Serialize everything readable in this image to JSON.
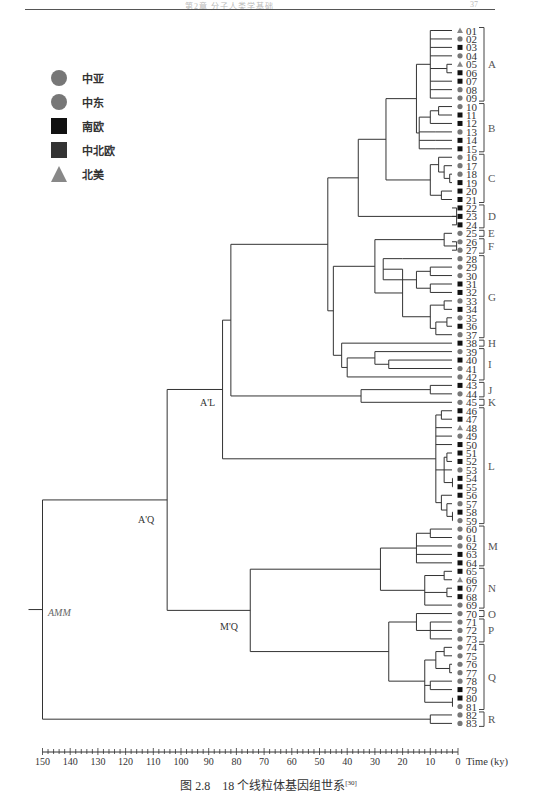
{
  "header": {
    "running_title": "第2章 分子人类学基础",
    "page_number": "37"
  },
  "legend": [
    {
      "label": "中亚",
      "shape": "circle",
      "color": "#777777"
    },
    {
      "label": "中东",
      "shape": "circle",
      "color": "#777777"
    },
    {
      "label": "南欧",
      "shape": "square",
      "color": "#111111"
    },
    {
      "label": "中北欧",
      "shape": "square",
      "color": "#333333"
    },
    {
      "label": "北美",
      "shape": "triangle",
      "color": "#888888"
    }
  ],
  "node_labels": {
    "root": "AMM",
    "aq": "A'Q",
    "al": "A'L",
    "mq": "M'Q"
  },
  "axis": {
    "label": "Time (ky)",
    "ticks": [
      "150",
      "140",
      "130",
      "120",
      "110",
      "100",
      "90",
      "80",
      "70",
      "60",
      "50",
      "40",
      "30",
      "20",
      "10",
      "0"
    ]
  },
  "caption": {
    "text": "图 2.8　18 个线粒体基因组世系",
    "ref": "[30]"
  },
  "chart_data": {
    "type": "dendrogram",
    "xlabel": "Time (ky)",
    "xlim": [
      150,
      0
    ],
    "tips": [
      "01",
      "02",
      "03",
      "04",
      "05",
      "06",
      "07",
      "08",
      "09",
      "10",
      "11",
      "12",
      "13",
      "14",
      "15",
      "16",
      "17",
      "18",
      "19",
      "20",
      "21",
      "22",
      "23",
      "24",
      "25",
      "26",
      "27",
      "28",
      "29",
      "30",
      "31",
      "32",
      "33",
      "34",
      "35",
      "36",
      "37",
      "38",
      "39",
      "40",
      "41",
      "42",
      "43",
      "44",
      "45",
      "46",
      "47",
      "48",
      "49",
      "50",
      "51",
      "52",
      "53",
      "54",
      "55",
      "56",
      "57",
      "58",
      "59",
      "60",
      "61",
      "62",
      "63",
      "64",
      "65",
      "66",
      "67",
      "68",
      "69",
      "70",
      "71",
      "72",
      "73",
      "74",
      "75",
      "76",
      "77",
      "78",
      "79",
      "80",
      "81",
      "82",
      "83"
    ],
    "tip_symbols": "tcsctssccc sscss cccss ssssc cccccs scscs cscsccs ccss tcs sscssscscc ccsss tssccccccccccssc c",
    "lineages": [
      {
        "name": "A",
        "from": "01",
        "to": "09"
      },
      {
        "name": "B",
        "from": "10",
        "to": "15"
      },
      {
        "name": "C",
        "from": "16",
        "to": "21"
      },
      {
        "name": "D",
        "from": "22",
        "to": "24"
      },
      {
        "name": "E",
        "from": "25",
        "to": "25"
      },
      {
        "name": "F",
        "from": "26",
        "to": "27"
      },
      {
        "name": "G",
        "from": "28",
        "to": "37"
      },
      {
        "name": "H",
        "from": "38",
        "to": "38"
      },
      {
        "name": "I",
        "from": "39",
        "to": "42"
      },
      {
        "name": "J",
        "from": "43",
        "to": "44"
      },
      {
        "name": "K",
        "from": "45",
        "to": "45"
      },
      {
        "name": "L",
        "from": "46",
        "to": "59"
      },
      {
        "name": "M",
        "from": "60",
        "to": "64"
      },
      {
        "name": "N",
        "from": "65",
        "to": "69"
      },
      {
        "name": "O",
        "from": "70",
        "to": "70"
      },
      {
        "name": "P",
        "from": "71",
        "to": "73"
      },
      {
        "name": "Q",
        "from": "74",
        "to": "81"
      },
      {
        "name": "R",
        "from": "82",
        "to": "83"
      }
    ],
    "internal_nodes": [
      {
        "label": "AMM",
        "time_ky": 150
      },
      {
        "label": "A'Q",
        "time_ky": 105
      },
      {
        "label": "A'L",
        "time_ky": 85
      },
      {
        "label": "M'Q",
        "time_ky": 75
      }
    ]
  }
}
